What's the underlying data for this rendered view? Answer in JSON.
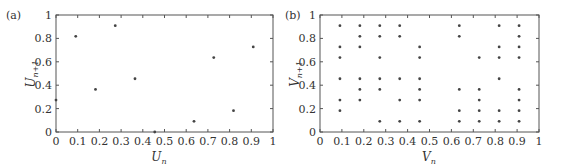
{
  "chart_data": [
    {
      "type": "scatter",
      "panel_label": "(a)",
      "title": "",
      "xlabel": "U_n",
      "ylabel": "U_{n+1}",
      "xlim": [
        0,
        1
      ],
      "ylim": [
        0,
        1
      ],
      "xticks": [
        "0",
        "0.1",
        "0.2",
        "0.3",
        "0.4",
        "0.5",
        "0.6",
        "0.7",
        "0.8",
        "0.9",
        "1"
      ],
      "yticks": [
        "0",
        "0.2",
        "0.4",
        "0.6",
        "0.8",
        "1"
      ],
      "grid": false,
      "marker": "dot",
      "points": [
        [
          0.0,
          0.273
        ],
        [
          0.091,
          0.818
        ],
        [
          0.182,
          0.364
        ],
        [
          0.273,
          0.909
        ],
        [
          0.364,
          0.455
        ],
        [
          0.455,
          0.0
        ],
        [
          0.636,
          0.091
        ],
        [
          0.727,
          0.636
        ],
        [
          0.818,
          0.182
        ],
        [
          0.909,
          0.727
        ]
      ]
    },
    {
      "type": "scatter",
      "panel_label": "(b)",
      "title": "",
      "xlabel": "V_n",
      "ylabel": "V_{n+1}",
      "xlim": [
        0,
        1
      ],
      "ylim": [
        0,
        1
      ],
      "xticks": [
        "0",
        "0.1",
        "0.2",
        "0.3",
        "0.4",
        "0.5",
        "0.6",
        "0.7",
        "0.8",
        "0.9",
        "1"
      ],
      "yticks": [
        "0",
        "0.2",
        "0.4",
        "0.6",
        "0.8",
        "1"
      ],
      "grid": false,
      "marker": "dot",
      "points": [
        [
          0.091,
          0.909
        ],
        [
          0.091,
          0.727
        ],
        [
          0.091,
          0.636
        ],
        [
          0.091,
          0.455
        ],
        [
          0.091,
          0.273
        ],
        [
          0.091,
          0.182
        ],
        [
          0.182,
          0.909
        ],
        [
          0.182,
          0.818
        ],
        [
          0.182,
          0.727
        ],
        [
          0.182,
          0.455
        ],
        [
          0.182,
          0.364
        ],
        [
          0.182,
          0.273
        ],
        [
          0.273,
          0.909
        ],
        [
          0.273,
          0.818
        ],
        [
          0.273,
          0.636
        ],
        [
          0.273,
          0.455
        ],
        [
          0.273,
          0.364
        ],
        [
          0.273,
          0.091
        ],
        [
          0.364,
          0.909
        ],
        [
          0.364,
          0.818
        ],
        [
          0.364,
          0.455
        ],
        [
          0.364,
          0.273
        ],
        [
          0.364,
          0.091
        ],
        [
          0.455,
          0.727
        ],
        [
          0.455,
          0.636
        ],
        [
          0.455,
          0.455
        ],
        [
          0.455,
          0.364
        ],
        [
          0.455,
          0.273
        ],
        [
          0.455,
          0.091
        ],
        [
          0.636,
          0.909
        ],
        [
          0.636,
          0.818
        ],
        [
          0.636,
          0.364
        ],
        [
          0.636,
          0.182
        ],
        [
          0.636,
          0.091
        ],
        [
          0.727,
          0.636
        ],
        [
          0.727,
          0.364
        ],
        [
          0.727,
          0.273
        ],
        [
          0.727,
          0.182
        ],
        [
          0.727,
          0.091
        ],
        [
          0.818,
          0.909
        ],
        [
          0.818,
          0.727
        ],
        [
          0.818,
          0.636
        ],
        [
          0.818,
          0.455
        ],
        [
          0.818,
          0.182
        ],
        [
          0.818,
          0.091
        ],
        [
          0.909,
          0.909
        ],
        [
          0.909,
          0.818
        ],
        [
          0.909,
          0.727
        ],
        [
          0.909,
          0.636
        ],
        [
          0.909,
          0.364
        ],
        [
          0.909,
          0.273
        ],
        [
          0.909,
          0.182
        ],
        [
          0.909,
          0.091
        ]
      ]
    }
  ],
  "panels": {
    "a": {
      "label": "(a)",
      "xlabel_main": "U",
      "xlabel_sub": "n",
      "ylabel_main": "U",
      "ylabel_sub": "n+1"
    },
    "b": {
      "label": "(b)",
      "xlabel_main": "V",
      "xlabel_sub": "n",
      "ylabel_main": "V",
      "ylabel_sub": "n+1"
    }
  },
  "colors": {
    "axis": "#555555",
    "marker": "#444444",
    "text": "#333333"
  }
}
